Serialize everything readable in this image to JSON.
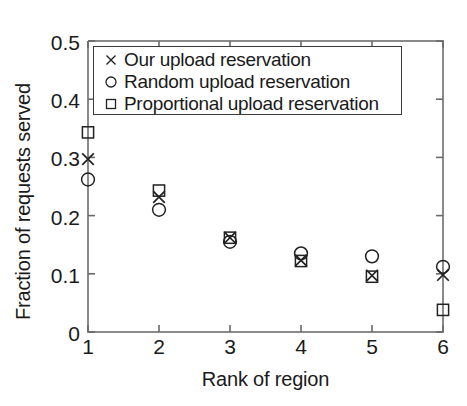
{
  "chart_data": {
    "type": "scatter",
    "title": "",
    "xlabel": "Rank of region",
    "ylabel": "Fraction of requests served",
    "x": [
      1,
      2,
      3,
      4,
      5,
      6
    ],
    "xlim": [
      1,
      6
    ],
    "ylim": [
      0,
      0.5
    ],
    "xticks": [
      "1",
      "2",
      "3",
      "4",
      "5",
      "6"
    ],
    "yticks": [
      "0",
      "0.1",
      "0.2",
      "0.3",
      "0.4",
      "0.5"
    ],
    "ytick_values": [
      0,
      0.1,
      0.2,
      0.3,
      0.4,
      0.5
    ],
    "grid": false,
    "legend_position": "upper-left-inside",
    "series": [
      {
        "name": "Our upload reservation",
        "marker": "x-marker",
        "color": "#222222",
        "values": [
          0.297,
          0.232,
          0.162,
          0.123,
          0.097,
          0.098
        ]
      },
      {
        "name": "Random upload reservation",
        "marker": "circle-marker",
        "color": "#222222",
        "values": [
          0.262,
          0.21,
          0.155,
          0.135,
          0.13,
          0.112
        ]
      },
      {
        "name": "Proportional upload reservation",
        "marker": "square-marker",
        "color": "#222222",
        "values": [
          0.343,
          0.243,
          0.162,
          0.122,
          0.095,
          0.038
        ]
      }
    ]
  },
  "axes": {
    "frame_color": "#8a8a8a",
    "tick_color": "#6a6a6a"
  }
}
